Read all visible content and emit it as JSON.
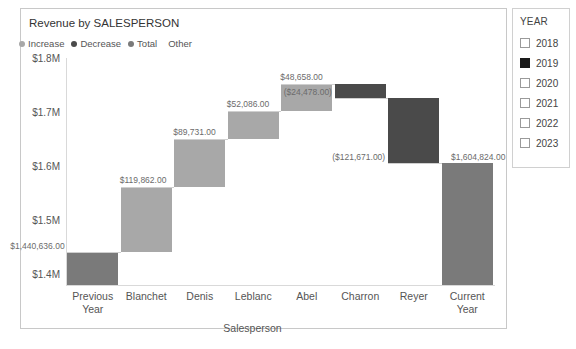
{
  "chart": {
    "title": "Revenue by SALESPERSON",
    "legend": [
      {
        "label": "Increase",
        "color": "#a8a8a8",
        "marker": true
      },
      {
        "label": "Decrease",
        "color": "#4a4a4a",
        "marker": true
      },
      {
        "label": "Total",
        "color": "#7a7a7a",
        "marker": true
      },
      {
        "label": "Other",
        "color": "#c8c8c8",
        "marker": false
      }
    ]
  },
  "chart_data": {
    "type": "bar",
    "subtype": "waterfall",
    "title": "Revenue by SALESPERSON",
    "xlabel": "Salesperson",
    "ylabel": "Revenue",
    "ylim": [
      1380000,
      1800000
    ],
    "yticks": [
      1400000,
      1500000,
      1600000,
      1700000,
      1800000
    ],
    "ytick_labels": [
      "$1.4M",
      "$1.5M",
      "$1.6M",
      "$1.7M",
      "$1.8M"
    ],
    "grid": false,
    "legend_position": "top-left",
    "categories": [
      "Previous Year",
      "Blanchet",
      "Denis",
      "Leblanc",
      "Abel",
      "Charron",
      "Reyer",
      "Current Year"
    ],
    "bars": [
      {
        "category": "Previous Year",
        "label": "$1,440,636.00",
        "value": 1440636,
        "kind": "total",
        "start": 1380000,
        "end": 1440636,
        "color": "#7a7a7a"
      },
      {
        "category": "Blanchet",
        "label": "$119,862.00",
        "value": 119862,
        "kind": "increase",
        "start": 1440636,
        "end": 1560498,
        "color": "#a8a8a8"
      },
      {
        "category": "Denis",
        "label": "$89,731.00",
        "value": 89731,
        "kind": "increase",
        "start": 1560498,
        "end": 1650229,
        "color": "#a8a8a8"
      },
      {
        "category": "Leblanc",
        "label": "$52,086.00",
        "value": 52086,
        "kind": "increase",
        "start": 1650229,
        "end": 1702315,
        "color": "#a8a8a8"
      },
      {
        "category": "Abel",
        "label": "$48,658.00",
        "value": 48658,
        "kind": "increase",
        "start": 1702315,
        "end": 1750973,
        "color": "#a8a8a8"
      },
      {
        "category": "Charron",
        "label": "($24,478.00)",
        "value": -24478,
        "kind": "decrease",
        "start": 1750973,
        "end": 1726495,
        "color": "#4a4a4a"
      },
      {
        "category": "Reyer",
        "label": "($121,671.00)",
        "value": -121671,
        "kind": "decrease",
        "start": 1726495,
        "end": 1604824,
        "color": "#4a4a4a"
      },
      {
        "category": "Current Year",
        "label": "$1,604,824.00",
        "value": 1604824,
        "kind": "total",
        "start": 1380000,
        "end": 1604824,
        "color": "#7a7a7a"
      }
    ]
  },
  "slicer": {
    "title": "YEAR",
    "options": [
      {
        "label": "2018",
        "checked": false
      },
      {
        "label": "2019",
        "checked": true
      },
      {
        "label": "2020",
        "checked": false
      },
      {
        "label": "2021",
        "checked": false
      },
      {
        "label": "2022",
        "checked": false
      },
      {
        "label": "2023",
        "checked": false
      }
    ]
  }
}
